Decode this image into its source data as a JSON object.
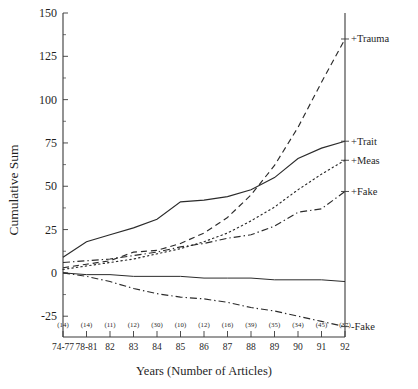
{
  "chart_data": {
    "type": "line",
    "title": "",
    "xlabel": "Years    (Number of Articles)",
    "ylabel": "Cumulative Sum",
    "ylim": [
      -37,
      150
    ],
    "yticks": [
      -25,
      0,
      25,
      50,
      75,
      100,
      125,
      150
    ],
    "ytick_labels": [
      "-25",
      "0",
      "25",
      "50",
      "75",
      "100",
      "125",
      "150"
    ],
    "grid": false,
    "legend_position": "right-inline-end-of-line",
    "categories": [
      "74-77",
      "78-81",
      "82",
      "83",
      "84",
      "85",
      "86",
      "87",
      "88",
      "89",
      "90",
      "91",
      "92"
    ],
    "article_counts": [
      "(14)",
      "(14)",
      "(11)",
      "(12)",
      "(30)",
      "(10)",
      "(12)",
      "(16)",
      "(39)",
      "(35)",
      "(34)",
      "(45)",
      "(37)"
    ],
    "series": [
      {
        "name": "+Trauma",
        "label": "+Trauma",
        "style": "dashed",
        "values": [
          3,
          5,
          7,
          12,
          13,
          17,
          23,
          32,
          45,
          62,
          84,
          110,
          135
        ]
      },
      {
        "name": "+Trait",
        "label": "+Trait",
        "style": "solid",
        "values": [
          9,
          18,
          22,
          26,
          31,
          41,
          42,
          44,
          48,
          55,
          66,
          72,
          76
        ]
      },
      {
        "name": "+Meas",
        "label": "+Meas",
        "style": "dotted",
        "values": [
          2,
          4,
          6,
          8,
          11,
          14,
          18,
          23,
          30,
          38,
          48,
          57,
          65
        ]
      },
      {
        "name": "+Fake",
        "label": "+Fake",
        "style": "dashdot",
        "values": [
          6,
          7,
          8,
          10,
          12,
          15,
          17,
          20,
          22,
          27,
          35,
          37,
          47
        ]
      },
      {
        "name": "-Fake",
        "label": "-Fake",
        "style": "dashdot",
        "values": [
          0,
          -2,
          -5,
          -9,
          -12,
          -14,
          -15,
          -17,
          -20,
          -22,
          -25,
          -28,
          -31
        ]
      },
      {
        "name": "baseline",
        "label": "",
        "style": "solid-baseline",
        "values": [
          0,
          -1,
          -1,
          -2,
          -2,
          -2,
          -3,
          -3,
          -3,
          -4,
          -4,
          -4,
          -5
        ]
      }
    ]
  }
}
